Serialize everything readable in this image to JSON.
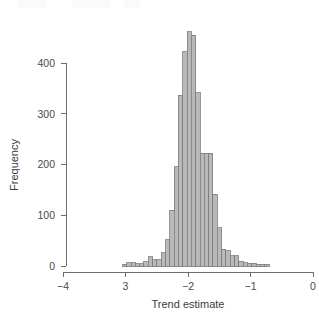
{
  "chart_data": {
    "type": "bar",
    "title": "",
    "subtitle": "",
    "xlabel": "Trend estimate",
    "ylabel": "Frequency",
    "xlim": [
      -4,
      0
    ],
    "ylim": [
      0,
      465
    ],
    "grid": false,
    "legend": null,
    "x_tick_labels": [
      "−4",
      "3",
      "−2",
      "−1",
      "0"
    ],
    "x_tick_values": [
      -4,
      -3,
      -2,
      -1,
      0
    ],
    "y_tick_labels": [
      "0",
      "100",
      "200",
      "300",
      "400"
    ],
    "y_tick_values": [
      0,
      100,
      200,
      300,
      400
    ],
    "bin_width": 0.069,
    "bin_edges": [
      -3.05,
      -2.981,
      -2.912,
      -2.843,
      -2.774,
      -2.705,
      -2.636,
      -2.567,
      -2.498,
      -2.429,
      -2.36,
      -2.291,
      -2.222,
      -2.153,
      -2.084,
      -2.015,
      -1.946,
      -1.877,
      -1.808,
      -1.739,
      -1.67,
      -1.601,
      -1.532,
      -1.463,
      -1.394,
      -1.325,
      -1.256,
      -1.187,
      -1.118,
      -1.049,
      -0.98,
      -0.911,
      -0.842,
      -0.773,
      -0.704
    ],
    "bin_centers": [
      -3.016,
      -2.947,
      -2.878,
      -2.809,
      -2.74,
      -2.671,
      -2.602,
      -2.533,
      -2.464,
      -2.395,
      -2.326,
      -2.257,
      -2.188,
      -2.119,
      -2.05,
      -1.981,
      -1.912,
      -1.843,
      -1.774,
      -1.705,
      -1.636,
      -1.567,
      -1.498,
      -1.429,
      -1.36,
      -1.291,
      -1.222,
      -1.153,
      -1.084,
      -1.015,
      -0.946,
      -0.877,
      -0.808,
      -0.739
    ],
    "values": [
      3,
      6,
      6,
      4,
      4,
      8,
      18,
      12,
      12,
      26,
      52,
      110,
      196,
      336,
      422,
      462,
      455,
      341,
      222,
      222,
      222,
      141,
      75,
      33,
      30,
      20,
      20,
      9,
      6,
      5,
      5,
      3,
      3,
      3
    ],
    "series": [
      {
        "name": "Trend estimate distribution",
        "values": [
          3,
          6,
          6,
          4,
          4,
          8,
          18,
          12,
          12,
          26,
          52,
          110,
          196,
          336,
          422,
          462,
          455,
          341,
          222,
          222,
          222,
          141,
          75,
          33,
          30,
          20,
          20,
          9,
          6,
          5,
          5,
          3,
          3,
          3
        ]
      }
    ],
    "bar_fill_color": "#b9b9b9",
    "bar_border_color": "#7d7d7d",
    "axis_color": "#6e6e6e",
    "text_color": "#4a4a4a"
  }
}
